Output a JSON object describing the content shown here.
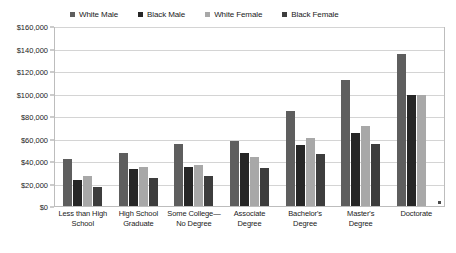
{
  "chart_data": {
    "type": "bar",
    "title": "",
    "subtitle": "",
    "xlabel": "",
    "ylabel": "",
    "ylim": [
      0,
      160000
    ],
    "ytick_values": [
      0,
      20000,
      40000,
      60000,
      80000,
      100000,
      120000,
      140000,
      160000
    ],
    "ytick_labels": [
      "$0",
      "$20,000",
      "$40,000",
      "$60,000",
      "$80,000",
      "$100,000",
      "$120,000",
      "$140,000",
      "$160,000"
    ],
    "grid": true,
    "legend_position": "top",
    "categories": [
      "Less than High School",
      "High School Graduate",
      "Some College—No Degree",
      "Associate Degree",
      "Bachelor's Degree",
      "Master's Degree",
      "Doctorate"
    ],
    "category_lines": [
      [
        "Less than High",
        "School"
      ],
      [
        "High School",
        "Graduate"
      ],
      [
        "Some College—",
        "No Degree"
      ],
      [
        "Associate",
        "Degree"
      ],
      [
        "Bachelor's",
        "Degree"
      ],
      [
        "Master's",
        "Degree"
      ],
      [
        "Doctorate",
        ""
      ]
    ],
    "series": [
      {
        "name": "White Male",
        "color": "#5e5e5e",
        "values": [
          42000,
          48000,
          56000,
          58000,
          85000,
          113000,
          137000
        ]
      },
      {
        "name": "Black Male",
        "color": "#262626",
        "values": [
          23000,
          33000,
          35000,
          48000,
          55000,
          66000,
          100000
        ]
      },
      {
        "name": "White Female",
        "color": "#a8a8a8",
        "values": [
          27000,
          35000,
          37000,
          44000,
          61000,
          72000,
          100000
        ]
      },
      {
        "name": "Black Female",
        "color": "#3d3d3d",
        "values": [
          17000,
          25000,
          27000,
          34000,
          47000,
          56000,
          0
        ]
      }
    ]
  },
  "legend": {
    "items": [
      {
        "label": "White Male",
        "color": "#5e5e5e"
      },
      {
        "label": "Black Male",
        "color": "#262626"
      },
      {
        "label": "White Female",
        "color": "#a8a8a8"
      },
      {
        "label": "Black Female",
        "color": "#3d3d3d"
      }
    ]
  },
  "colors": {
    "plot_border": "#bdbdbd",
    "gridline": "#d4d4d4",
    "background": "#ffffff",
    "text": "#1a1a1a"
  }
}
